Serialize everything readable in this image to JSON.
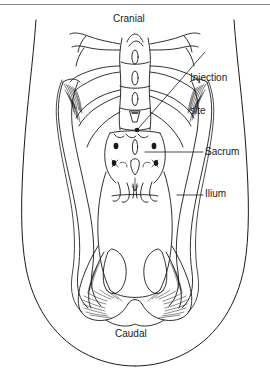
{
  "figure": {
    "kind": "anatomical-line-drawing",
    "view": "dorsal view of rabbit hindquarters showing lumbar spine, sacrum, ilium and pelvis",
    "background_color": "#ffffff",
    "ink_color": "#1a1a1a",
    "rule_color": "#8c8c8c"
  },
  "labels": {
    "cranial": "Cranial",
    "injection_line1": "Injection",
    "injection_line2": "site",
    "sacrum": "Sacrum",
    "ilium": "Ilium",
    "caudal": "Caudal"
  },
  "markers": {
    "injection_site_dot": "filled dot at end of injection leader line",
    "injection_leader": "diagonal leader line from label to injection point",
    "sacrum_leader": "horizontal leader line from sacrum to label",
    "ilium_leader": "horizontal leader line from ilium to label"
  }
}
